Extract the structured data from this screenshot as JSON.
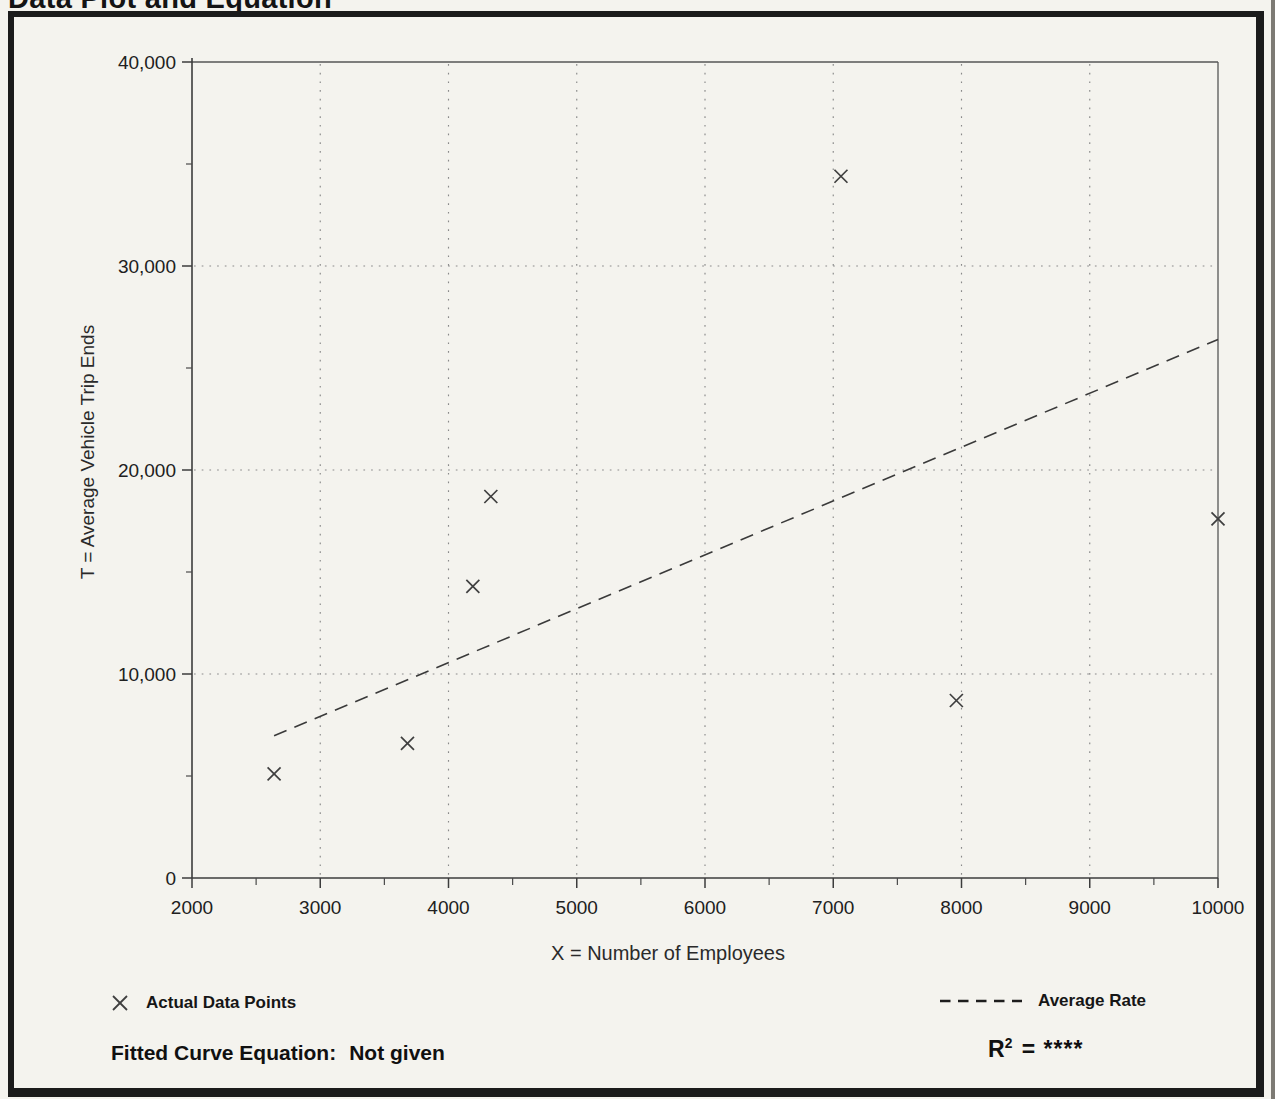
{
  "document": {
    "title": "Data Plot and Equation"
  },
  "chart_data": {
    "type": "scatter",
    "title": "Data Plot and Equation",
    "xlabel": "X = Number of Employees",
    "ylabel": "T = Average Vehicle Trip Ends",
    "xlim": [
      2000,
      10000
    ],
    "ylim": [
      0,
      40000
    ],
    "grid": "dotted",
    "x_ticks": [
      2000,
      3000,
      4000,
      5000,
      6000,
      7000,
      8000,
      9000,
      10000
    ],
    "x_tick_labels": [
      "2000",
      "3000",
      "4000",
      "5000",
      "6000",
      "7000",
      "8000",
      "9000",
      "10000"
    ],
    "x_minor_ticks": [
      2500,
      3500,
      4500,
      5500,
      6500,
      7500,
      8500,
      9500
    ],
    "y_ticks": [
      0,
      10000,
      20000,
      30000,
      40000
    ],
    "y_tick_labels": [
      "0",
      "10,000",
      "20,000",
      "30,000",
      "40,000"
    ],
    "y_minor_ticks": [
      5000,
      15000,
      25000,
      35000
    ],
    "series": [
      {
        "name": "Actual Data Points",
        "marker": "x",
        "points": [
          {
            "x": 2640,
            "y": 5100
          },
          {
            "x": 3680,
            "y": 6600
          },
          {
            "x": 4190,
            "y": 14300
          },
          {
            "x": 4330,
            "y": 18700
          },
          {
            "x": 7060,
            "y": 34400
          },
          {
            "x": 7960,
            "y": 8700
          },
          {
            "x": 10000,
            "y": 17600
          }
        ]
      }
    ],
    "trend_line": {
      "name": "Average Rate",
      "style": "dashed",
      "rate_per_unit": 2.64,
      "x_start": 2640,
      "y_start": 6970,
      "x_end": 10000,
      "y_end": 26400
    },
    "legend_position": "bottom"
  },
  "legend": {
    "data_points_label": "Actual Data Points",
    "average_rate_label": "Average Rate"
  },
  "footer": {
    "fitted_label": "Fitted Curve Equation:",
    "fitted_value": "Not given",
    "r2_base": "R",
    "r2_sup": "2",
    "r2_rest": "= ****"
  },
  "colors": {
    "paper": "#f4f3ee",
    "ink": "#141414",
    "frame_line": "#565656",
    "grid_dot": "#8a8a8a",
    "marker": "#3f3f3f"
  }
}
